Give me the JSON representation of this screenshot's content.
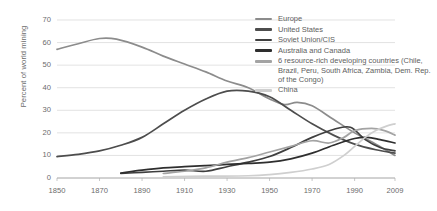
{
  "chart_data": {
    "type": "line",
    "title": "",
    "xlabel": "",
    "ylabel": "Percent of world mining",
    "xlim": [
      1850,
      2009
    ],
    "ylim": [
      0,
      70
    ],
    "grid": true,
    "legend_position": "top-right",
    "xticks": [
      "1850",
      "1870",
      "1890",
      "1910",
      "1930",
      "1950",
      "1970",
      "1990",
      "2009"
    ],
    "yticks": [
      "0",
      "10",
      "20",
      "30",
      "40",
      "50",
      "60",
      "70"
    ],
    "series": [
      {
        "name": "Europe",
        "color": "#8c8c8c",
        "x": [
          1850,
          1860,
          1870,
          1878,
          1890,
          1900,
          1910,
          1920,
          1930,
          1940,
          1950,
          1957,
          1963,
          1970,
          1980,
          1990,
          2000,
          2009
        ],
        "values": [
          57,
          59.5,
          61.8,
          61.5,
          58,
          54,
          50.5,
          47,
          43,
          40,
          35,
          32.5,
          33.5,
          32,
          26,
          20,
          15,
          10
        ]
      },
      {
        "name": "United States",
        "color": "#4d4d4d",
        "x": [
          1850,
          1860,
          1870,
          1880,
          1890,
          1900,
          1910,
          1920,
          1930,
          1940,
          1950,
          1960,
          1970,
          1980,
          1990,
          2000,
          2009
        ],
        "values": [
          9.5,
          10.5,
          12,
          14.5,
          18,
          24,
          30,
          35,
          38.5,
          38.5,
          36,
          30,
          24,
          19,
          15,
          12.5,
          11
        ]
      },
      {
        "name": "Soviet Union/CIS",
        "color": "#3f3f3f",
        "x": [
          1880,
          1890,
          1900,
          1910,
          1920,
          1930,
          1940,
          1950,
          1960,
          1970,
          1980,
          1988,
          1995,
          2002,
          2009
        ],
        "values": [
          2,
          2.5,
          3,
          3.5,
          3,
          5,
          7,
          9.5,
          13.5,
          18,
          21.5,
          22.5,
          17,
          13.5,
          12
        ]
      },
      {
        "name": "Australia and Canada",
        "color": "#2e2e2e",
        "x": [
          1880,
          1890,
          1900,
          1910,
          1920,
          1930,
          1940,
          1950,
          1960,
          1970,
          1980,
          1990,
          1996,
          2002,
          2009
        ],
        "values": [
          2.2,
          3.5,
          4.5,
          5,
          5.5,
          6,
          6.5,
          7,
          8.5,
          11,
          14.5,
          17.5,
          18,
          17,
          15.5
        ]
      },
      {
        "name": "6 resource-rich developing countries (Chile, Brazil, Peru, South Africa, Zambia, Dem. Rep. of the Congo)",
        "color": "#a3a3a3",
        "x": [
          1900,
          1910,
          1920,
          1930,
          1940,
          1950,
          1960,
          1970,
          1978,
          1985,
          1990,
          1998,
          2004,
          2009
        ],
        "values": [
          2,
          3,
          4.5,
          7,
          9,
          11.5,
          14,
          16.5,
          15.5,
          18,
          21,
          22,
          21,
          19
        ]
      },
      {
        "name": "China",
        "color": "#cfcfcf",
        "x": [
          1900,
          1920,
          1940,
          1950,
          1960,
          1970,
          1978,
          1985,
          1990,
          1995,
          2000,
          2005,
          2009
        ],
        "values": [
          0.5,
          0.8,
          1,
          1.5,
          2.5,
          4,
          6,
          10,
          14,
          18,
          21,
          23,
          24
        ]
      }
    ]
  },
  "legend": {
    "items": [
      {
        "label": "Europe"
      },
      {
        "label": "United States"
      },
      {
        "label": "Soviet Union/CIS"
      },
      {
        "label": "Australia and Canada"
      },
      {
        "label": "6 resource-rich developing countries (Chile, Brazil, Peru, South Africa, Zambia, Dem. Rep. of the Congo)"
      },
      {
        "label": "China"
      }
    ]
  }
}
